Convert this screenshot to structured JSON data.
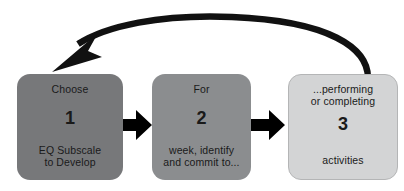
{
  "diagram": {
    "type": "cyclical-process-flow",
    "steps": [
      {
        "id": "step-1",
        "caption": "Choose",
        "number": "1",
        "detail": "EQ Subscale\nto Develop",
        "fill": "#77787a"
      },
      {
        "id": "step-2",
        "caption": "For",
        "number": "2",
        "detail": "week, identify\nand commit to...",
        "fill": "#8b8d8f"
      },
      {
        "id": "step-3",
        "caption": "...performing\nor completing",
        "number": "3",
        "detail": "activities",
        "fill": "#d3d4d5"
      }
    ],
    "connectors": [
      {
        "id": "connector-1",
        "icon": "right-arrow-icon",
        "from": "step-1",
        "to": "step-2",
        "color": "#000000"
      },
      {
        "id": "connector-2",
        "icon": "right-arrow-icon",
        "from": "step-2",
        "to": "step-3",
        "color": "#000000"
      }
    ],
    "feedback_arrow": {
      "id": "feedback-arrow",
      "icon": "curved-feedback-arrow-icon",
      "from": "step-3",
      "to": "step-1",
      "color": "#111111"
    }
  }
}
